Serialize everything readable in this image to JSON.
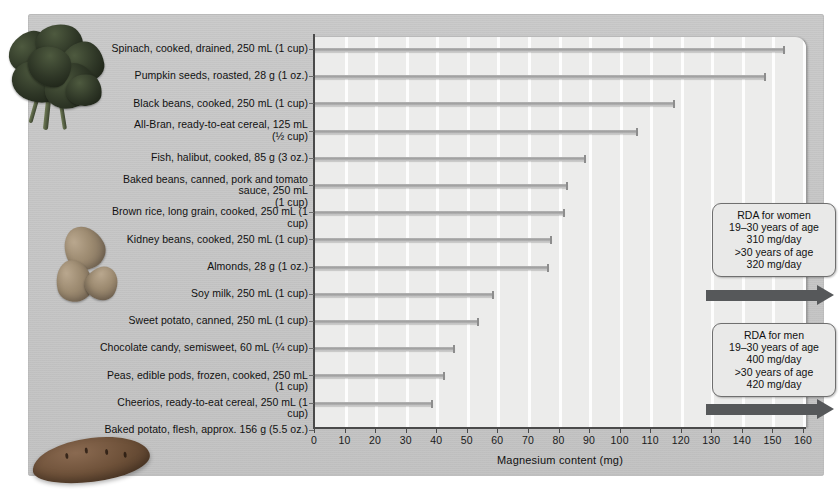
{
  "chart_data": {
    "type": "bar",
    "orientation": "horizontal",
    "title": "",
    "xlabel": "Magnesium content (mg)",
    "ylabel": "",
    "xlim": [
      0,
      160
    ],
    "xticks": [
      0,
      10,
      20,
      30,
      40,
      50,
      60,
      70,
      80,
      90,
      100,
      110,
      120,
      130,
      140,
      150,
      160
    ],
    "grid": true,
    "legend": "none",
    "categories": [
      "Spinach, cooked, drained, 250 mL (1 cup)",
      "Pumpkin seeds, roasted, 28 g (1 oz.)",
      "Black beans, cooked, 250 mL (1 cup)",
      "All-Bran, ready-to-eat cereal, 125 mL\n(½ cup)",
      "Fish, halibut, cooked, 85 g (3 oz.)",
      "Baked beans, canned, pork and tomato sauce, 250 mL\n(1 cup)",
      "Brown rice, long grain, cooked, 250 mL (1 cup)",
      "Kidney beans, cooked, 250 mL (1 cup)",
      "Almonds, 28 g (1 oz.)",
      "Soy milk, 250 mL (1 cup)",
      "Sweet potato, canned, 250 mL (1 cup)",
      "Chocolate candy, semisweet, 60 mL (¼ cup)",
      "Peas, edible pods, frozen, cooked, 250 mL (1 cup)",
      "Cheerios, ready-to-eat cereal, 250 mL (1 cup)",
      "Baked potato, flesh, approx. 156 g (5.5 oz.)"
    ],
    "values": [
      154,
      148,
      118,
      106,
      89,
      83,
      82,
      78,
      77,
      59,
      54,
      46,
      43,
      39,
      38
    ]
  },
  "callouts": [
    {
      "id": "rda-women",
      "title": "RDA for women",
      "line1": "19–30 years of age",
      "line2": "310 mg/day",
      "line3": ">30 years of age",
      "line4": "320 mg/day",
      "text": "RDA for women\n19–30 years of age\n310 mg/day\n>30 years of age\n320 mg/day"
    },
    {
      "id": "rda-men",
      "title": "RDA for men",
      "line1": "19–30 years of age",
      "line2": "400 mg/day",
      "line3": ">30 years of age",
      "line4": "420 mg/day",
      "text": "RDA for men\n19–30 years of age\n400 mg/day\n>30 years of age\n420 mg/day"
    }
  ],
  "photos": [
    {
      "name": "spinach-photo"
    },
    {
      "name": "almonds-photo"
    },
    {
      "name": "sweet-potato-photo"
    }
  ],
  "colors": {
    "card_background": "#c6c6c6",
    "plot_background": "#ececeb",
    "bar": "#9e9e9e",
    "axis": "#4a4a4a",
    "arrow": "#56585a",
    "callout_background": "#e9e9e8",
    "callout_border": "#6f6f6f",
    "gridline": "#fdfdfd"
  }
}
